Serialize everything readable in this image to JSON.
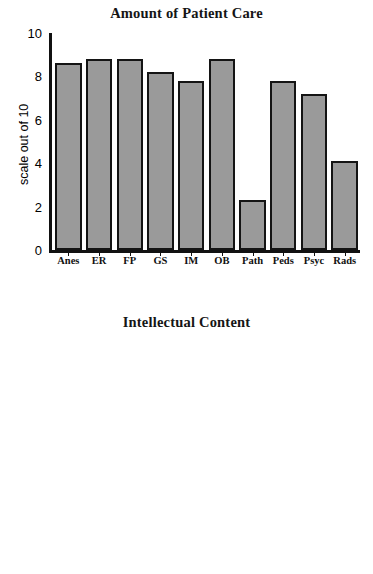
{
  "figure": {
    "categories": [
      "Anes",
      "ER",
      "FP",
      "GS",
      "IM",
      "OB",
      "Path",
      "Peds",
      "Psyc",
      "Rads"
    ],
    "yticks": [
      "10",
      "8",
      "6",
      "4",
      "2",
      "0"
    ],
    "ylabel": "scale out of 10",
    "bar_fill_color": "#9a9a9a",
    "bar_edge_color": "#141414",
    "axis_color": "#111111"
  },
  "chart_data": [
    {
      "type": "bar",
      "title": "Amount of Patient Care",
      "xlabel": "",
      "ylabel": "scale out of 10",
      "categories": [
        "Anes",
        "ER",
        "FP",
        "GS",
        "IM",
        "OB",
        "Path",
        "Peds",
        "Psyc",
        "Rads"
      ],
      "values": [
        8.6,
        8.8,
        8.8,
        8.2,
        7.8,
        8.8,
        2.3,
        7.8,
        7.2,
        4.1
      ],
      "ylim": [
        0,
        10
      ],
      "ytick_values": [
        0,
        2,
        4,
        6,
        8,
        10
      ],
      "grid": false,
      "legend": false
    },
    {
      "type": "bar",
      "title": "Intellectual Content",
      "xlabel": "",
      "ylabel": "scale out of 10",
      "categories": [
        "Anes",
        "ER",
        "FP",
        "GS",
        "IM",
        "OB",
        "Path",
        "Peds",
        "Psyc",
        "Rads"
      ],
      "values": [
        3.2,
        3.25,
        4.2,
        3.85,
        5.05,
        3.9,
        4.5,
        4.6,
        5.9,
        3.7
      ],
      "ylim": [
        0,
        10
      ],
      "ytick_values": [
        0,
        2,
        4,
        6,
        8,
        10
      ],
      "grid": false,
      "legend": false
    }
  ]
}
